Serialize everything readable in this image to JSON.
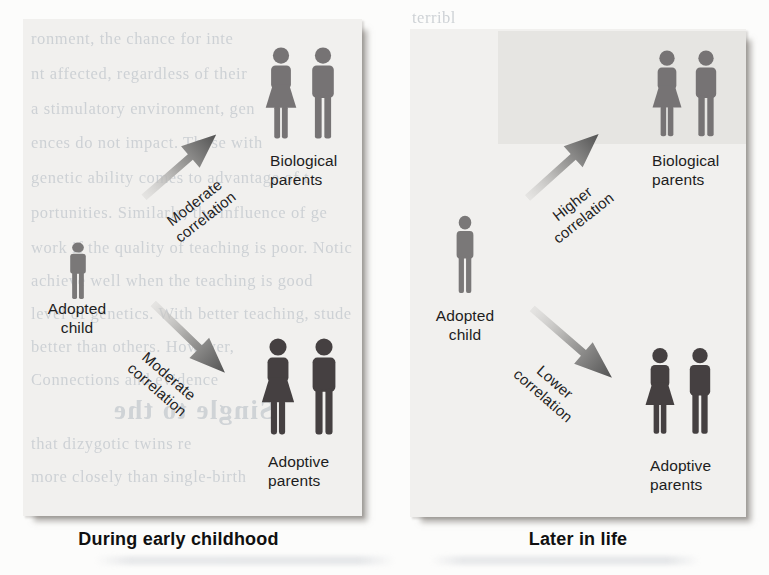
{
  "colors": {
    "page_bg": "#fcfcfb",
    "panel_bg": "#f1f0ee",
    "panel_band": "#e6e5e2",
    "person_gray": "#767374",
    "person_dark": "#454041",
    "child_gray": "#7a7878",
    "arrow_light": "#d8d7d5",
    "arrow_dark": "#525252",
    "label_text": "#1d1d1d",
    "caption_text": "#101010",
    "bleed_text": "#ccd0d4"
  },
  "figure": {
    "panels": [
      {
        "caption": "During early childhood",
        "adopted_child": {
          "line1": "Adopted",
          "line2": "child"
        },
        "biological_parents": {
          "line1": "Biological",
          "line2": "parents"
        },
        "adoptive_parents": {
          "line1": "Adoptive",
          "line2": "parents"
        },
        "arrow_to_biological": {
          "line1": "Moderate",
          "line2": "correlation"
        },
        "arrow_to_adoptive": {
          "line1": "Moderate",
          "line2": "correlation"
        }
      },
      {
        "caption": "Later in life",
        "adopted_child": {
          "line1": "Adopted",
          "line2": "child"
        },
        "biological_parents": {
          "line1": "Biological",
          "line2": "parents"
        },
        "adoptive_parents": {
          "line1": "Adoptive",
          "line2": "parents"
        },
        "arrow_to_biological": {
          "line1": "Higher",
          "line2": "correlation"
        },
        "arrow_to_adoptive": {
          "line1": "Lower",
          "line2": "correlation"
        }
      }
    ]
  },
  "bleedthrough": {
    "left_lines": [
      "ronment, the chance for inte",
      "nt affected, regardless of their",
      "a stimulatory environment, gen",
      "ences do not impact. Those with",
      "genetic ability comes to advantage of t",
      "portunities. Similarly, the influence of ge",
      "work if the quality of teaching is poor. Notic",
      "achieve well when the teaching is good",
      "level of genetics. With better teaching, stude",
      "better than others. However,",
      "Connections and evidence",
      "that dizygotic twins re",
      "more closely than single-birth"
    ],
    "left_heading": "Single to the",
    "right_fragments": [
      "terribl",
      "develop",
      "for th",
      "ference",
      "genetic",
      "portuni",
      "work t",
      "achiev"
    ]
  }
}
